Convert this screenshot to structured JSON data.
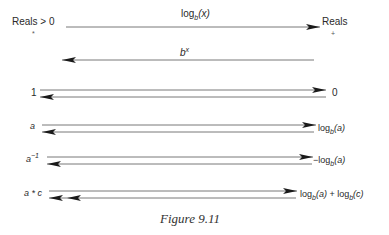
{
  "figure": {
    "caption": "Figure 9.11",
    "header": {
      "left_label": "Reals > 0",
      "left_mark": "*",
      "right_label": "Reals",
      "right_mark": "+",
      "forward_map": {
        "base": "log",
        "sub": "b",
        "arg": "(x)"
      },
      "inverse_map": {
        "base": "b",
        "sup": "x"
      }
    },
    "rows": [
      {
        "left": "1",
        "right": "0"
      },
      {
        "left": "a",
        "right": {
          "pre": "",
          "base": "log",
          "sub": "b",
          "arg": "(a)"
        }
      },
      {
        "left": {
          "base": "a",
          "sup": "−1"
        },
        "right": {
          "pre": "−",
          "base": "log",
          "sub": "b",
          "arg": "(a)"
        }
      },
      {
        "left": "a * c",
        "right": {
          "text": "log_b(a) + log_b(c)",
          "p1": "log",
          "s1": "b",
          "a1": "(a)",
          "plus": " + ",
          "p2": "log",
          "s2": "b",
          "a2": "(c)"
        }
      }
    ],
    "colors": {
      "line": "#6a6a6a",
      "arrowhead": "#1a1a1a",
      "text": "#2a2a2a"
    }
  }
}
